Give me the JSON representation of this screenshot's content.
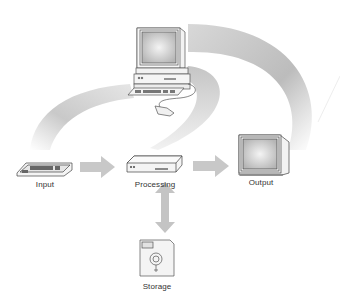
{
  "diagram": {
    "nodes": [
      {
        "id": "input",
        "label": "Input",
        "icon": "keyboard-icon"
      },
      {
        "id": "processing",
        "label": "Processing",
        "icon": "system-unit-icon"
      },
      {
        "id": "output",
        "label": "Output",
        "icon": "monitor-icon"
      },
      {
        "id": "storage",
        "label": "Storage",
        "icon": "floppy-disk-icon"
      }
    ],
    "central_icon": "desktop-computer-icon",
    "edges": [
      {
        "from": "input",
        "to": "processing",
        "style": "arrow"
      },
      {
        "from": "processing",
        "to": "output",
        "style": "arrow"
      },
      {
        "from": "processing",
        "to": "storage",
        "style": "double-arrow"
      }
    ],
    "colors": {
      "arrow": "#c8c8c8",
      "swoosh": "#bdbdbd",
      "line": "#555555",
      "text": "#333333"
    }
  }
}
